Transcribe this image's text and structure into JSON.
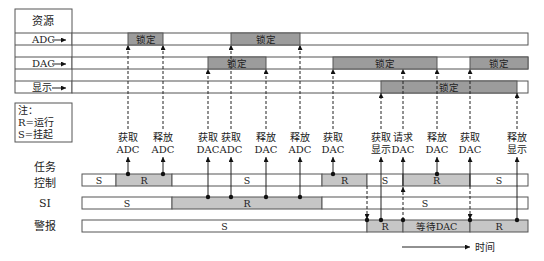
{
  "resources": {
    "header": "资源",
    "rows": [
      {
        "name": "ADC",
        "locks": [
          {
            "label": "锁定"
          },
          {
            "label": "锁定"
          }
        ]
      },
      {
        "name": "DAC",
        "locks": [
          {
            "label": "锁定"
          },
          {
            "label": "锁定"
          },
          {
            "label": "锁定"
          }
        ]
      },
      {
        "name": "显示",
        "locks": [
          {
            "label": "锁定"
          }
        ]
      }
    ]
  },
  "legend": {
    "title": "注：",
    "lines": [
      "R=运行",
      "S=挂起"
    ]
  },
  "events": [
    {
      "action": "获取",
      "resource": "ADC"
    },
    {
      "action": "释放",
      "resource": "ADC"
    },
    {
      "action": "获取",
      "resource": "DAC"
    },
    {
      "action": "获取",
      "resource": "ADC"
    },
    {
      "action": "释放",
      "resource": "DAC"
    },
    {
      "action": "释放",
      "resource": "ADC"
    },
    {
      "action": "获取",
      "resource": "DAC"
    },
    {
      "action": "获取",
      "resource": "显示"
    },
    {
      "action": "请求",
      "resource": "DAC"
    },
    {
      "action": "释放",
      "resource": "DAC"
    },
    {
      "action": "获取",
      "resource": "DAC"
    },
    {
      "action": "释放",
      "resource": "显示"
    }
  ],
  "tasks": [
    {
      "name": [
        "任务",
        "控制"
      ],
      "segments": [
        "S",
        "R",
        "S",
        "R",
        "S",
        "R",
        "S"
      ]
    },
    {
      "name": [
        "SI"
      ],
      "segments": [
        "S",
        "R",
        "S"
      ]
    },
    {
      "name": [
        "警报"
      ],
      "segments": [
        "S",
        "R",
        "等待DAC",
        "R"
      ]
    }
  ],
  "time_axis": {
    "label": "时间"
  }
}
